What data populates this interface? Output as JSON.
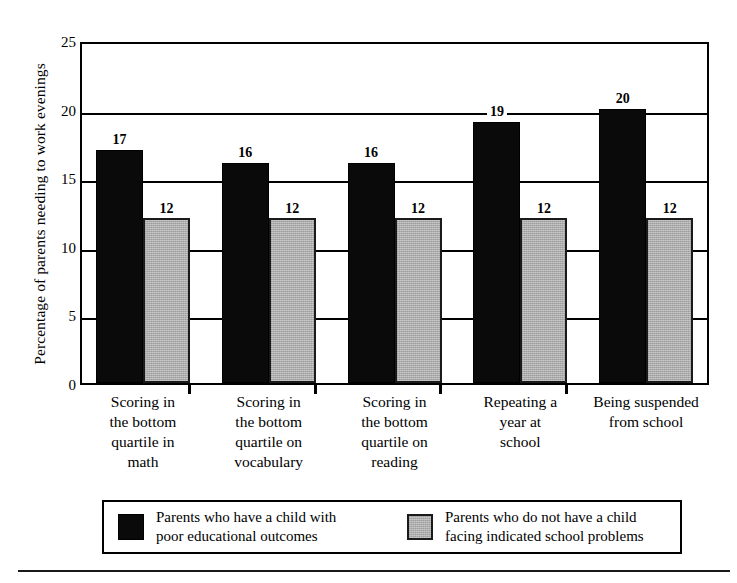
{
  "chart_data": {
    "type": "bar",
    "title": "",
    "subtitle": "",
    "xlabel": "",
    "ylabel": "Percentage of parents needing to work evenings",
    "ylim": [
      0,
      25
    ],
    "yticks": [
      0,
      5,
      10,
      15,
      20,
      25
    ],
    "ytick_labels": [
      "0",
      "5",
      "10",
      "15",
      "20",
      "25"
    ],
    "grid": true,
    "grid_axis": "y",
    "legend_position": "bottom",
    "categories": [
      "Scoring in\nthe bottom\nquartile in\nmath",
      "Scoring in\nthe bottom\nquartile on\nvocabulary",
      "Scoring in\nthe bottom\nquartile on\nreading",
      "Repeating a\nyear at\nschool",
      "Being suspended\nfrom school"
    ],
    "series": [
      {
        "name": "Parents who have a child with\npoor educational outcomes",
        "color": "#0a0a0a",
        "values": [
          17,
          16,
          16,
          19,
          20
        ],
        "value_labels": [
          "17",
          "16",
          "16",
          "19",
          "20"
        ]
      },
      {
        "name": "Parents who do not have a child\nfacing indicated school problems",
        "color": "#aeaeae",
        "values": [
          12,
          12,
          12,
          12,
          12
        ],
        "value_labels": [
          "12",
          "12",
          "12",
          "12",
          "12"
        ]
      }
    ]
  },
  "legend": {
    "entries": [
      {
        "label": "Parents who have a child with\npoor educational outcomes",
        "swatch": "dark"
      },
      {
        "label": "Parents who do not have a child\nfacing indicated school problems",
        "swatch": "light"
      }
    ]
  }
}
